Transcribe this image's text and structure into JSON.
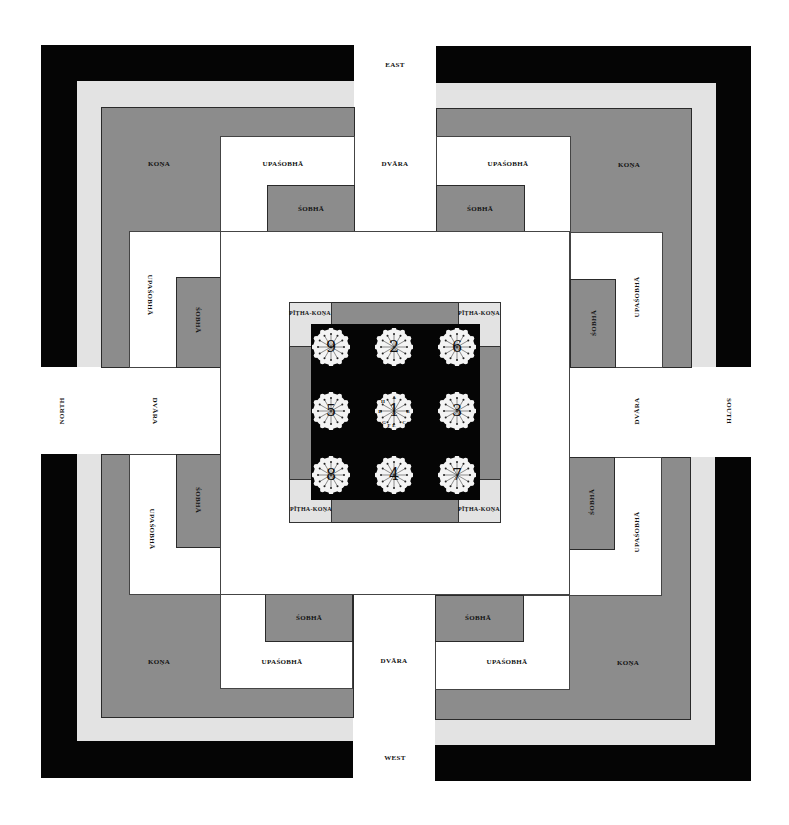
{
  "diagram": {
    "type": "mandala-plan",
    "colors": {
      "outer_band": "#050505",
      "light_band": "#e3e3e3",
      "dark_band": "#8c8c8c",
      "white": "#ffffff",
      "pitha_black": "#050505"
    },
    "directions": {
      "east": "EAST",
      "west": "WEST",
      "north": "NORTH",
      "south": "SOUTH"
    },
    "gates": {
      "east": "DVĀRA",
      "west": "DVĀRA",
      "north": "DVĀRA",
      "south": "DVĀRA"
    },
    "quadrants": {
      "nw": {
        "kona": "KOṆA",
        "upasobha_h": "UPAŚOBHĀ",
        "sobha_h": "ŚOBHĀ",
        "upasobha_v": "UPAŚOBHĀ",
        "sobha_v": "ŚOBHĀ"
      },
      "ne": {
        "kona": "KOṆA",
        "upasobha_h": "UPAŚOBHĀ",
        "sobha_h": "ŚOBHĀ",
        "upasobha_v": "UPAŚOBHĀ",
        "sobha_v": "ŚOBHĀ"
      },
      "sw": {
        "kona": "KOṆA",
        "upasobha_h": "UPAŚOBHĀ",
        "sobha_h": "ŚOBHĀ",
        "upasobha_v": "UPAŚOBHĀ",
        "sobha_v": "ŚOBHĀ"
      },
      "se": {
        "kona": "KOṆA",
        "upasobha_h": "UPAŚOBHĀ",
        "sobha_h": "ŚOBHĀ",
        "upasobha_v": "UPAŚOBHĀ",
        "sobha_v": "ŚOBHĀ"
      }
    },
    "pitha": {
      "corner_label": "PĪṬHA-KOṆA",
      "corners": [
        "PĪṬHA-KOṆA",
        "PĪṬHA-KOṆA",
        "PĪṬHA-KOṆA",
        "PĪṬHA-KOṆA"
      ],
      "lotus_grid": [
        [
          "9",
          "2",
          "6"
        ],
        [
          "5",
          "1",
          "3"
        ],
        [
          "8",
          "4",
          "7"
        ]
      ],
      "center_letters": [
        "A",
        "B",
        "C",
        "D",
        "E",
        "F",
        "G",
        "H"
      ]
    }
  }
}
